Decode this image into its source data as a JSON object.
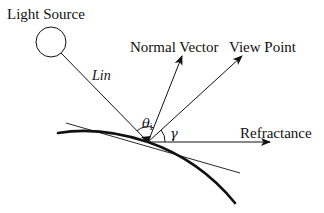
{
  "diagram": {
    "type": "reflection-geometry",
    "colors": {
      "stroke": "#111111",
      "background": "#ffffff"
    },
    "labels": {
      "light_source": "Light Source",
      "incident_ray": "Lin",
      "normal_vector": "Normal Vector",
      "view_point": "View Point",
      "refractance": "Refractance",
      "incidence_angle_symbol": "θ",
      "incidence_angle_subscript": "i",
      "view_angle_symbol": "γ"
    },
    "elements": [
      {
        "name": "light-source",
        "shape": "circle"
      },
      {
        "name": "incident-ray",
        "shape": "line",
        "from": "light-source",
        "to": "contact-point"
      },
      {
        "name": "normal-vector",
        "shape": "arrow",
        "from": "contact-point"
      },
      {
        "name": "view-point-vector",
        "shape": "arrow",
        "from": "contact-point"
      },
      {
        "name": "refractance-vector",
        "shape": "arrow",
        "from": "contact-point",
        "direction": "horizontal"
      },
      {
        "name": "tangent-line",
        "shape": "line"
      },
      {
        "name": "surface-curve",
        "shape": "thick-curve"
      }
    ]
  }
}
